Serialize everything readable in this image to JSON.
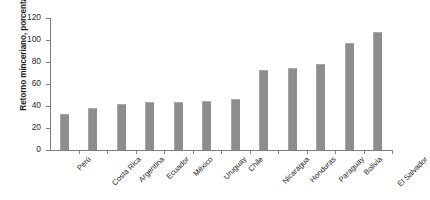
{
  "chart_data": {
    "type": "bar",
    "title": "",
    "xlabel": "",
    "ylabel": "Retorno minceriano, porcentaje",
    "categories": [
      "Perú",
      "Costa Rica",
      "Argentina",
      "Ecuador",
      "México",
      "Uruguay",
      "Chile",
      "Nicaragua",
      "Honduras",
      "Paraguay",
      "Bolivia",
      "El Salvador"
    ],
    "values": [
      33,
      38,
      42,
      44,
      44,
      45,
      46,
      73,
      75,
      78,
      97,
      107
    ],
    "ylim": [
      0,
      120
    ],
    "yticks": [
      0,
      20,
      40,
      60,
      80,
      100,
      120
    ],
    "ytick_labels": [
      "0",
      "20",
      "40",
      "60",
      "80",
      "100",
      "120"
    ],
    "grid": false,
    "legend": false,
    "bar_color": "#8d8d8d",
    "axis_color": "#7d7d7d",
    "background": "#ffffff"
  }
}
